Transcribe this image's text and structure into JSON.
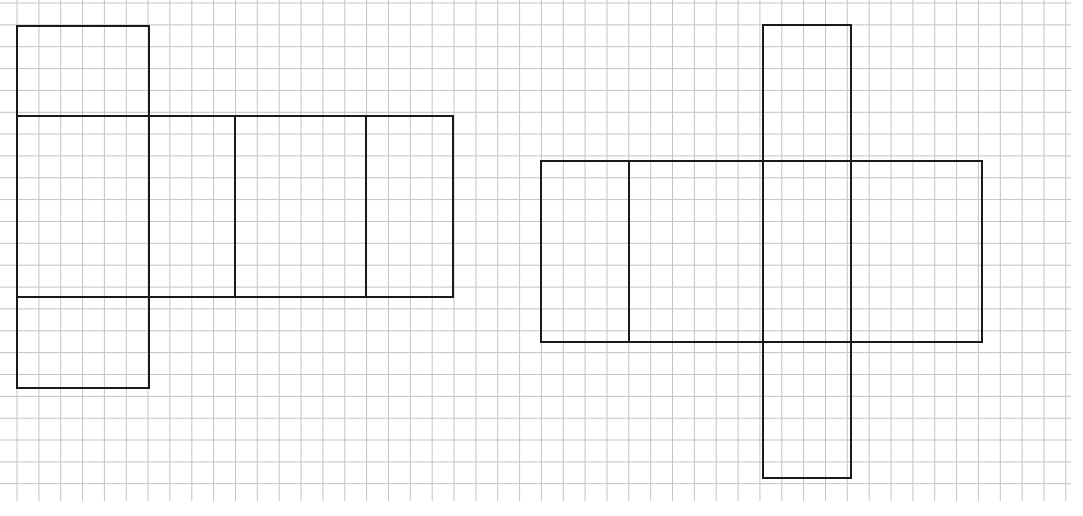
{
  "diagram": {
    "grid": {
      "origin_x": 0,
      "origin_y": 3,
      "cell": 21.85,
      "cols": 49,
      "rows": 23,
      "x_start": -4.85,
      "line_color": "#c4c4c4",
      "right_edge": 1071,
      "bottom_edge": 501
    },
    "stroke_color": "#1a1a1a",
    "nets": [
      {
        "name": "net-left",
        "rects": [
          {
            "label": "top-flap",
            "x1": 17,
            "y1": 26,
            "x2": 149,
            "y2": 116
          },
          {
            "label": "face-1",
            "x1": 17,
            "y1": 116,
            "x2": 149,
            "y2": 297
          },
          {
            "label": "face-2",
            "x1": 149,
            "y1": 116,
            "x2": 235,
            "y2": 297
          },
          {
            "label": "face-3",
            "x1": 235,
            "y1": 116,
            "x2": 366,
            "y2": 297
          },
          {
            "label": "face-4",
            "x1": 366,
            "y1": 116,
            "x2": 453,
            "y2": 297
          },
          {
            "label": "bottom-flap",
            "x1": 17,
            "y1": 297,
            "x2": 149,
            "y2": 388
          }
        ]
      },
      {
        "name": "net-right",
        "rects": [
          {
            "label": "top-flap",
            "x1": 763,
            "y1": 25,
            "x2": 851,
            "y2": 161
          },
          {
            "label": "face-1",
            "x1": 541,
            "y1": 161,
            "x2": 629,
            "y2": 342
          },
          {
            "label": "face-2",
            "x1": 629,
            "y1": 161,
            "x2": 763,
            "y2": 342
          },
          {
            "label": "face-3",
            "x1": 763,
            "y1": 161,
            "x2": 851,
            "y2": 342
          },
          {
            "label": "face-4",
            "x1": 851,
            "y1": 161,
            "x2": 982,
            "y2": 342
          },
          {
            "label": "bottom-flap",
            "x1": 763,
            "y1": 342,
            "x2": 851,
            "y2": 478
          }
        ]
      }
    ]
  }
}
